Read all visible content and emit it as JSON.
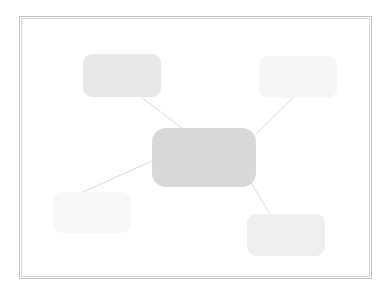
{
  "diagram": {
    "type": "mind-map",
    "frame": {
      "border_color_outer": "#c4c4c4",
      "border_color_inner": "#d6d6d6"
    },
    "connector_color": "#dcdcdc",
    "nodes": [
      {
        "id": "center",
        "label": "",
        "x": 152,
        "y": 128,
        "w": 104,
        "h": 59,
        "radius": 14,
        "fill": "#d9d9d9"
      },
      {
        "id": "top-left",
        "label": "",
        "x": 83,
        "y": 54,
        "w": 78,
        "h": 43,
        "radius": 9,
        "fill": "#e8e8e8"
      },
      {
        "id": "top-right",
        "label": "",
        "x": 259,
        "y": 56,
        "w": 78,
        "h": 42,
        "radius": 9,
        "fill": "#f6f6f6"
      },
      {
        "id": "bottom-left",
        "label": "",
        "x": 53,
        "y": 192,
        "w": 78,
        "h": 41,
        "radius": 9,
        "fill": "#f8f8f8"
      },
      {
        "id": "bottom-right",
        "label": "",
        "x": 247,
        "y": 214,
        "w": 78,
        "h": 42,
        "radius": 9,
        "fill": "#efefef"
      }
    ],
    "edges": [
      {
        "from": "center",
        "to": "top-left",
        "x1": 182,
        "y1": 128,
        "x2": 141,
        "y2": 97
      },
      {
        "from": "center",
        "to": "top-right",
        "x1": 255,
        "y1": 135,
        "x2": 293,
        "y2": 98
      },
      {
        "from": "center",
        "to": "bottom-left",
        "x1": 152,
        "y1": 161,
        "x2": 83,
        "y2": 192
      },
      {
        "from": "center",
        "to": "bottom-right",
        "x1": 250,
        "y1": 181,
        "x2": 270,
        "y2": 214
      }
    ]
  }
}
